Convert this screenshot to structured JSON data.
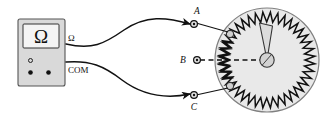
{
  "figure": {
    "background_color": "#ffffff",
    "line_color": "#111111"
  },
  "meter": {
    "name": "ohmmeter",
    "body_fill": "#d9d9d9",
    "body_stroke": "#555555",
    "display": {
      "symbol": "Ω",
      "face_fill": "#f2f2f2"
    },
    "jacks": [
      {
        "id": "jack-open",
        "glyph": "○",
        "filled": false
      },
      {
        "id": "jack-ohm",
        "glyph": "●",
        "filled": true
      },
      {
        "id": "jack-com",
        "glyph": "●",
        "filled": true
      }
    ],
    "jack_labels": {
      "ohm": "Ω",
      "com": "COM"
    }
  },
  "rheostat": {
    "name": "circular-rheostat",
    "disc_fill": "#e8e8e8",
    "disc_stroke": "#777777",
    "coil_color": "#111111",
    "coil_teeth": 46,
    "pointer": {
      "name": "pointer-needle",
      "fill": "#dcdcdc",
      "stroke": "#333333",
      "angle_deg": -100
    },
    "terminals": [
      {
        "label": "A",
        "role": "upper-tap",
        "label_position": "above-left"
      },
      {
        "label": "B",
        "role": "center-wiper",
        "label_position": "left"
      },
      {
        "label": "C",
        "role": "lower-tap",
        "label_position": "below"
      }
    ],
    "wiper_link": {
      "name": "wiper-dashed-link",
      "style": "dashed",
      "from": "B",
      "to": "pivot-hub"
    }
  },
  "wires": [
    {
      "name": "wire-ohm-to-A",
      "from": "Ω",
      "to": "A"
    },
    {
      "name": "wire-com-to-C",
      "from": "COM",
      "to": "C"
    }
  ]
}
